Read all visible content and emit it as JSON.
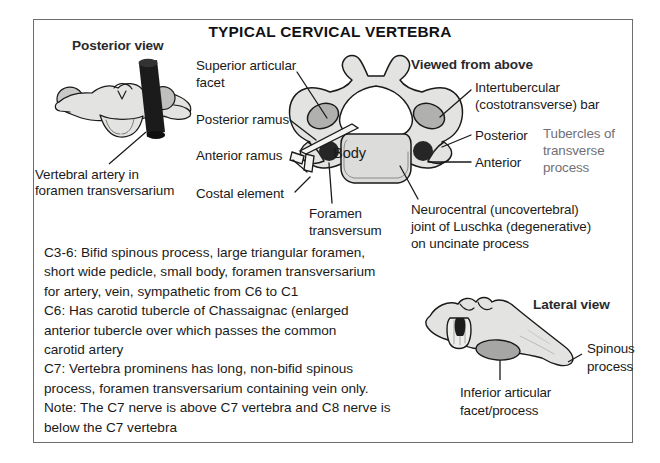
{
  "figure": {
    "title": "TYPICAL CERVICAL VERTEBRA",
    "border_color": "#6e6e72",
    "background": "#ffffff",
    "ink_color": "#1a1a1a",
    "secondary_text_color": "#707076",
    "bone_fill": "#e3e3e1",
    "facet_fill": "#b0b0ae",
    "body_fill": "#dcdcda",
    "artery_fill": "#1b1b1b"
  },
  "panels": {
    "posterior": {
      "heading": "Posterior view",
      "caption_line1": "Vertebral artery in",
      "caption_line2": "foramen transversarium"
    },
    "superior": {
      "heading": "Viewed from above",
      "center_label": "Body",
      "labels_left": [
        {
          "line1": "Superior articular",
          "line2": "facet"
        },
        {
          "line1": "Posterior ramus"
        },
        {
          "line1": "Anterior ramus"
        },
        {
          "line1": "Costal element"
        }
      ],
      "labels_bottom": [
        {
          "line1": "Foramen",
          "line2": "transversum"
        },
        {
          "line1": "Neurocentral (uncovertebral)",
          "line2": "joint of Luschka (degenerative)",
          "line3": "on uncinate process"
        }
      ],
      "labels_right": [
        {
          "line1": "Intertubercular",
          "line2": "(costotransverse) bar"
        },
        {
          "line1": "Posterior"
        },
        {
          "line1": "Anterior"
        }
      ],
      "bracket_label": {
        "line1": "Tubercles of",
        "line2": "transverse",
        "line3": "process"
      }
    },
    "lateral": {
      "heading": "Lateral view",
      "label_spinous": {
        "line1": "Spinous",
        "line2": "process"
      },
      "label_inferior": {
        "line1": "Inferior articular",
        "line2": "facet/process"
      }
    }
  },
  "notes": {
    "paragraphs": [
      "C3-6:  Bifid spinous process, large triangular foramen,",
      "short wide pedicle, small body, foramen transversarium",
      "for artery, vein, sympathetic from C6 to C1",
      "C6: Has carotid tubercle of Chassaignac (enlarged",
      "anterior tubercle over which passes the common",
      "carotid artery",
      "C7: Vertebra prominens has long, non-bifid spinous",
      "process, foramen transversarium containing vein only.",
      "Note: The C7 nerve is above C7 vertebra and C8 nerve is",
      "below the C7 vertebra"
    ]
  }
}
